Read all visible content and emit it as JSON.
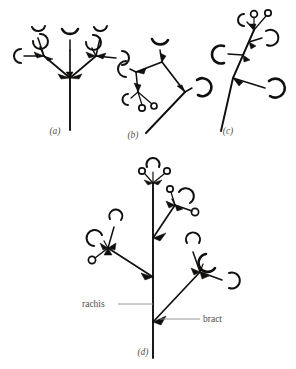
{
  "figure": {
    "background_color": "#ffffff",
    "ink_color": "#100f0d",
    "label_color": "#55504e",
    "leader_color": "#8e8a88",
    "panels": [
      {
        "id": "a",
        "label": "(a)",
        "label_x": 55,
        "label_y": 134,
        "type": "umbel",
        "description": "Umbel-like inflorescence: three branches arise from one point at the top of an unbranched peduncle, each bearing flowers subtended by bracts.",
        "flower_count": 7,
        "bract_count": 5
      },
      {
        "id": "b",
        "label": "(b)",
        "label_x": 133,
        "label_y": 138,
        "type": "cyme",
        "description": "Cymose inflorescence branching to the left and upward, with terminal flowers and progressively smaller lateral buds.",
        "flower_count": 5,
        "bract_count": 4
      },
      {
        "id": "c",
        "label": "(c)",
        "label_x": 228,
        "label_y": 134,
        "type": "raceme",
        "description": "Raceme: flowers borne on short pedicels along an elongated, unbranched, obliquely ascending axis, oldest at the base.",
        "flower_count": 5,
        "bract_count": 4
      },
      {
        "id": "d",
        "label": "(d)",
        "label_x": 143,
        "label_y": 355,
        "type": "panicle",
        "description": "Panicle: a compound raceme in which the main axis (rachis) bears branched lateral inflorescences, each subtended by a bract.",
        "flower_count": 11,
        "bract_count": 9
      }
    ],
    "annotations": [
      {
        "id": "rachis",
        "text": "rachis",
        "text_x": 82,
        "text_y": 307,
        "anchor": "start",
        "leader": {
          "x1": 118,
          "y1": 304,
          "x2": 153,
          "y2": 304
        },
        "description": "Main axis of the compound inflorescence in panel (d)."
      },
      {
        "id": "bract",
        "text": "bract",
        "text_x": 203,
        "text_y": 322,
        "anchor": "start",
        "leader": {
          "x1": 200,
          "y1": 319,
          "x2": 160,
          "y2": 319
        },
        "description": "Reduced leaf subtending a lateral branch of the inflorescence."
      }
    ]
  }
}
